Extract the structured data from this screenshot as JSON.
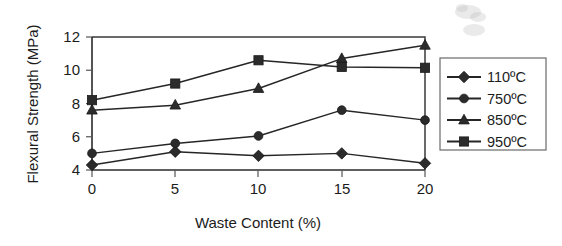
{
  "chart_data": {
    "type": "line",
    "title": "",
    "xlabel": "Waste Content (%)",
    "ylabel": "Flexural Strength (MPa)",
    "x": [
      0,
      5,
      10,
      15,
      20
    ],
    "xlim": [
      0,
      20
    ],
    "ylim": [
      4,
      12
    ],
    "xticks": [
      "0",
      "5",
      "10",
      "15",
      "20"
    ],
    "yticks": [
      "4",
      "6",
      "8",
      "10",
      "12"
    ],
    "grid": false,
    "legend_position": "right",
    "series": [
      {
        "name": "110ºC",
        "marker": "diamond",
        "values": [
          4.3,
          5.1,
          4.85,
          5.0,
          4.4
        ]
      },
      {
        "name": "750ºC",
        "marker": "circle",
        "values": [
          5.0,
          5.6,
          6.05,
          7.6,
          7.0
        ]
      },
      {
        "name": "850ºC",
        "marker": "triangle",
        "values": [
          7.6,
          7.9,
          8.9,
          10.7,
          11.5
        ]
      },
      {
        "name": "950ºC",
        "marker": "square",
        "values": [
          8.2,
          9.2,
          10.6,
          10.2,
          10.15
        ]
      }
    ]
  },
  "axes": {
    "y_title": "Flexural Strength (MPa)",
    "x_title": "Waste Content (%)",
    "y_tick_labels": [
      "12",
      "10",
      "8",
      "6",
      "4"
    ],
    "x_tick_labels": [
      "0",
      "5",
      "10",
      "15",
      "20"
    ]
  },
  "legend": {
    "entries": [
      {
        "label": "110ºC",
        "marker": "diamond"
      },
      {
        "label": "750ºC",
        "marker": "circle"
      },
      {
        "label": "850ºC",
        "marker": "triangle"
      },
      {
        "label": "950ºC",
        "marker": "square"
      }
    ]
  },
  "colors": {
    "ink": "#262626",
    "frame": "#3a3a3a",
    "background": "#ffffff"
  }
}
